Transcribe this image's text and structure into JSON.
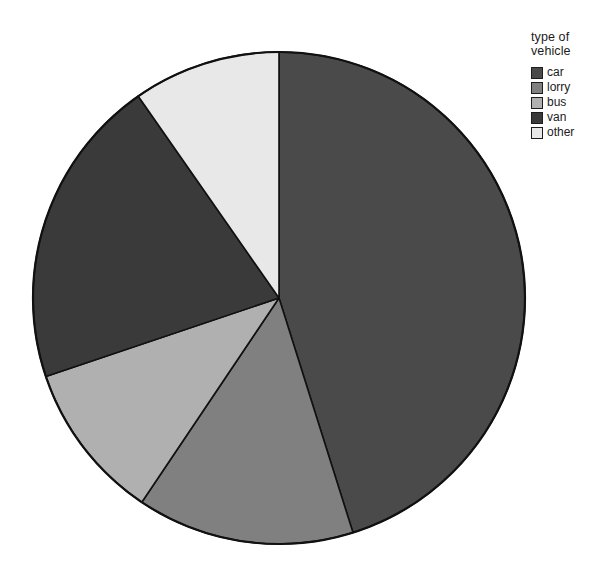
{
  "chart_data": {
    "type": "pie",
    "title": "",
    "legend_title": "type of\nvehicle",
    "legend_position": "right",
    "grid": false,
    "start_angle_deg": 0,
    "direction": "clockwise",
    "categories": [
      "car",
      "lorry",
      "bus",
      "van",
      "other"
    ],
    "values": [
      45.1,
      14.3,
      10.4,
      20.5,
      9.7
    ],
    "unit": "percent",
    "angles_deg": [
      162.5,
      51.4,
      37.5,
      73.7,
      34.9
    ],
    "boundary_angles_deg": [
      0,
      162.5,
      213.9,
      251.4,
      325.1,
      360
    ],
    "colors": [
      "#4a4a4a",
      "#808080",
      "#b0b0b0",
      "#3a3a3a",
      "#e8e8e8"
    ],
    "xlabel": "",
    "ylabel": "",
    "annotations": []
  },
  "legend": {
    "title": "type of\nvehicle",
    "items": [
      {
        "label": "car",
        "color": "#4a4a4a"
      },
      {
        "label": "lorry",
        "color": "#808080"
      },
      {
        "label": "bus",
        "color": "#b0b0b0"
      },
      {
        "label": "van",
        "color": "#3a3a3a"
      },
      {
        "label": "other",
        "color": "#e8e8e8"
      }
    ]
  },
  "geometry": {
    "center_x": 279,
    "center_y": 298,
    "radius": 246,
    "outline_color": "#111111"
  }
}
